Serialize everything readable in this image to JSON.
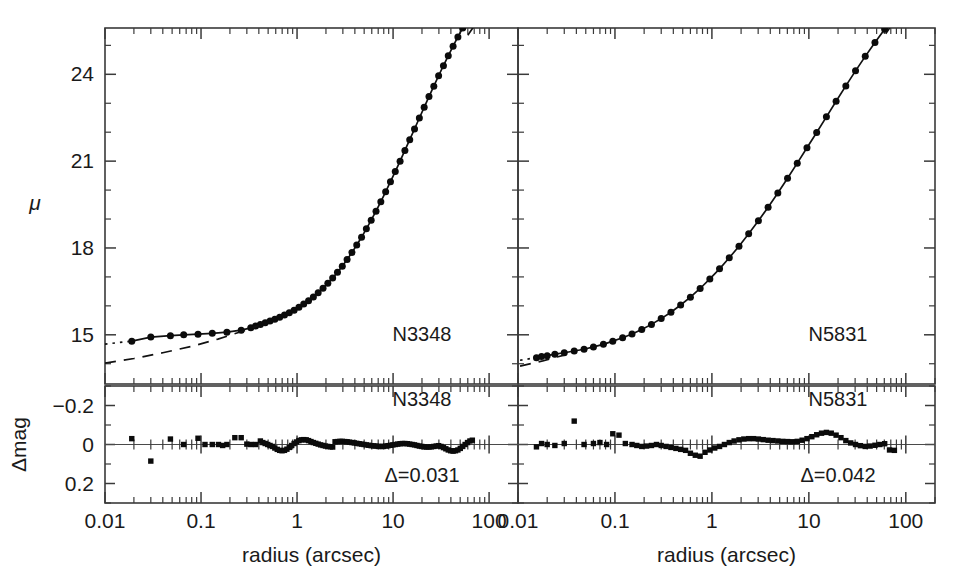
{
  "figure": {
    "background": "#ffffff",
    "ink_color": "#1a1a1a",
    "width": 962,
    "height": 576
  },
  "axis_titles": {
    "x": "radius (arcsec)",
    "y_main": "μ",
    "y_resid": "Δmag"
  },
  "x_tick_labels": [
    "0.01",
    "0.1",
    "1",
    "10",
    "100"
  ],
  "x_tick_values": [
    0.01,
    0.1,
    1,
    10,
    100
  ],
  "y_main_tick_labels": [
    "15",
    "18",
    "21",
    "24"
  ],
  "y_main_tick_values": [
    15,
    18,
    21,
    24
  ],
  "y_resid_tick_labels": [
    "−0.2",
    "0",
    "0.2"
  ],
  "y_resid_tick_values": [
    -0.2,
    0,
    0.2
  ],
  "panels": [
    {
      "id": "left",
      "galaxy_label": "N3348",
      "resid_galaxy_label": "N3348",
      "delta_label": "Δ=0.031"
    },
    {
      "id": "right",
      "galaxy_label": "N5831",
      "resid_galaxy_label": "N5831",
      "delta_label": "Δ=0.042"
    }
  ],
  "chart_data": {
    "type": "line",
    "title": "",
    "subtitle": "",
    "xlabel": "radius (arcsec)",
    "ylabel": "μ",
    "xscale": "log",
    "xlim": [
      0.01,
      200
    ],
    "grid": false,
    "legend": "none",
    "subplots": [
      {
        "name": "N3348",
        "panel": "left-main",
        "ylabel": "μ",
        "ylim": [
          25.6,
          13.3
        ],
        "y_inverted": true,
        "annotations": [
          {
            "text": "N3348",
            "x": 20,
            "y": 14.8
          }
        ],
        "series": [
          {
            "name": "observed surface brightness",
            "style": "solid-with-filled-circles",
            "marker": "filled-circle",
            "x": [
              0.019,
              0.03,
              0.048,
              0.066,
              0.093,
              0.131,
              0.186,
              0.262,
              0.33,
              0.37,
              0.415,
              0.466,
              0.523,
              0.587,
              0.659,
              0.74,
              0.83,
              0.932,
              1.046,
              1.174,
              1.318,
              1.479,
              1.66,
              1.864,
              2.092,
              2.349,
              2.636,
              2.959,
              3.321,
              3.728,
              4.184,
              4.697,
              5.272,
              5.918,
              6.643,
              7.456,
              8.369,
              9.394,
              10.54,
              11.83,
              13.28,
              14.91,
              16.73,
              18.78,
              21.08,
              23.66,
              26.56,
              29.81,
              33.46,
              37.56,
              42.16,
              47.32,
              53.12,
              59.62,
              66.92
            ],
            "y": [
              14.78,
              14.92,
              14.97,
              15.0,
              15.02,
              15.05,
              15.09,
              15.16,
              15.24,
              15.3,
              15.36,
              15.42,
              15.48,
              15.54,
              15.61,
              15.68,
              15.76,
              15.85,
              15.95,
              16.06,
              16.18,
              16.31,
              16.45,
              16.61,
              16.78,
              16.96,
              17.16,
              17.37,
              17.6,
              17.84,
              18.1,
              18.37,
              18.66,
              18.96,
              19.27,
              19.6,
              19.94,
              20.29,
              20.64,
              21.0,
              21.37,
              21.74,
              22.11,
              22.49,
              22.86,
              23.23,
              23.59,
              23.95,
              24.3,
              24.64,
              24.97,
              25.29,
              25.6,
              25.88,
              26.12
            ]
          },
          {
            "name": "inward dotted extrapolation",
            "style": "dotted",
            "x": [
              0.01,
              0.019
            ],
            "y": [
              14.68,
              14.78
            ]
          },
          {
            "name": "outer power-law dashed extrapolation",
            "style": "dashed",
            "x": [
              0.01,
              0.02,
              0.04,
              0.08,
              0.15,
              0.28,
              0.4
            ],
            "y": [
              14.02,
              14.18,
              14.38,
              14.6,
              14.85,
              15.14,
              15.32
            ]
          },
          {
            "name": "outer dash-dot extrapolation",
            "style": "dash-dot",
            "x": [
              60.0,
              90.0,
              130.0,
              175.0
            ],
            "y": [
              25.35,
              26.2,
              27.1,
              27.9
            ]
          }
        ]
      },
      {
        "name": "N3348 residuals",
        "panel": "left-resid",
        "ylabel": "Δmag",
        "ylim": [
          -0.3,
          0.3
        ],
        "y_inverted": true,
        "rms": 0.031,
        "annotations": [
          {
            "text": "N3348",
            "x": 20,
            "y": -0.2
          },
          {
            "text": "Δ=0.031",
            "x": 20,
            "y": 0.19
          }
        ],
        "series": [
          {
            "name": "fit residuals",
            "style": "filled-squares",
            "marker": "filled-square",
            "x": [
              0.019,
              0.03,
              0.048,
              0.066,
              0.093,
              0.11,
              0.131,
              0.152,
              0.168,
              0.186,
              0.225,
              0.262,
              0.3,
              0.33,
              0.37,
              0.415,
              0.44,
              0.466,
              0.495,
              0.523,
              0.555,
              0.587,
              0.622,
              0.659,
              0.698,
              0.74,
              0.784,
              0.83,
              0.88,
              0.932,
              0.988,
              1.046,
              1.109,
              1.174,
              1.245,
              1.318,
              1.397,
              1.479,
              1.568,
              1.66,
              1.76,
              1.864,
              1.975,
              2.092,
              2.218,
              2.349,
              2.489,
              2.636,
              2.794,
              2.959,
              3.136,
              3.321,
              3.519,
              3.728,
              3.95,
              4.184,
              4.433,
              4.697,
              4.977,
              5.272,
              5.586,
              5.918,
              6.27,
              6.643,
              7.038,
              7.456,
              7.9,
              8.369,
              8.867,
              9.394,
              9.953,
              10.54,
              11.17,
              11.83,
              12.53,
              13.28,
              14.07,
              14.91,
              15.8,
              16.73,
              17.73,
              18.78,
              19.9,
              21.08,
              22.34,
              23.66,
              25.07,
              26.56,
              28.14,
              29.81,
              31.58,
              33.46,
              35.45,
              37.56,
              39.8,
              42.16,
              44.67,
              47.32,
              50.14,
              53.12,
              56.28,
              59.62,
              63.17,
              66.92
            ],
            "y": [
              -0.03,
              0.085,
              -0.028,
              0.0,
              -0.032,
              0.0,
              0.0,
              0.0,
              0.005,
              0.0,
              -0.035,
              -0.035,
              -0.002,
              0.0,
              0.0,
              -0.018,
              -0.01,
              -0.005,
              0.0,
              0.005,
              0.01,
              0.018,
              0.025,
              0.03,
              0.032,
              0.03,
              0.024,
              0.015,
              0.005,
              -0.005,
              -0.013,
              -0.02,
              -0.024,
              -0.025,
              -0.024,
              -0.02,
              -0.015,
              -0.01,
              -0.006,
              -0.002,
              0.002,
              0.005,
              0.008,
              0.01,
              0.012,
              0.013,
              -0.014,
              -0.015,
              -0.016,
              -0.016,
              -0.015,
              -0.014,
              -0.012,
              -0.01,
              -0.008,
              -0.006,
              -0.004,
              -0.002,
              0.0,
              0.002,
              0.004,
              0.006,
              0.007,
              0.008,
              0.01,
              0.01,
              0.01,
              0.008,
              0.006,
              0.004,
              0.002,
              0.0,
              -0.002,
              -0.004,
              -0.005,
              -0.005,
              -0.004,
              -0.002,
              0.0,
              0.002,
              0.005,
              0.008,
              0.01,
              0.012,
              0.013,
              0.013,
              0.012,
              0.01,
              0.008,
              0.006,
              0.01,
              0.016,
              0.022,
              0.028,
              0.032,
              0.034,
              0.032,
              0.028,
              0.02,
              0.01,
              0.0,
              -0.01,
              -0.018,
              -0.022
            ]
          }
        ]
      },
      {
        "name": "N5831",
        "panel": "right-main",
        "ylabel": "μ",
        "ylim": [
          25.6,
          13.3
        ],
        "y_inverted": true,
        "annotations": [
          {
            "text": "N5831",
            "x": 20,
            "y": 14.8
          }
        ],
        "series": [
          {
            "name": "observed surface brightness",
            "style": "solid-with-filled-circles",
            "marker": "filled-circle",
            "x": [
              0.0155,
              0.0175,
              0.02,
              0.024,
              0.03,
              0.038,
              0.048,
              0.06,
              0.076,
              0.095,
              0.12,
              0.15,
              0.189,
              0.238,
              0.3,
              0.378,
              0.476,
              0.6,
              0.756,
              0.952,
              1.199,
              1.51,
              1.902,
              2.395,
              3.017,
              3.8,
              4.786,
              6.028,
              7.592,
              9.562,
              12.04,
              15.17,
              19.1,
              24.06,
              30.3,
              38.16,
              48.06,
              60.53,
              76.24
            ],
            "y": [
              14.21,
              14.25,
              14.28,
              14.33,
              14.38,
              14.44,
              14.5,
              14.58,
              14.67,
              14.78,
              14.9,
              15.03,
              15.18,
              15.36,
              15.56,
              15.78,
              16.03,
              16.3,
              16.6,
              16.93,
              17.28,
              17.66,
              18.06,
              18.49,
              18.94,
              19.41,
              19.9,
              20.41,
              20.93,
              21.46,
              21.99,
              22.53,
              23.07,
              23.6,
              24.12,
              24.62,
              25.1,
              25.56,
              25.99
            ]
          },
          {
            "name": "inward dotted extrapolation",
            "style": "dotted",
            "x": [
              0.0105,
              0.0155
            ],
            "y": [
              14.12,
              14.21
            ]
          },
          {
            "name": "inner dashed extrapolation",
            "style": "dashed",
            "x": [
              0.0105,
              0.018,
              0.03
            ],
            "y": [
              13.92,
              14.1,
              14.3
            ]
          },
          {
            "name": "outer dash-dot extrapolation",
            "style": "dash-dot",
            "x": [
              62.0,
              90.0,
              130.0,
              180.0
            ],
            "y": [
              25.4,
              26.2,
              27.05,
              27.85
            ]
          }
        ]
      },
      {
        "name": "N5831 residuals",
        "panel": "right-resid",
        "ylabel": "Δmag",
        "ylim": [
          -0.3,
          0.3
        ],
        "y_inverted": true,
        "rms": 0.042,
        "annotations": [
          {
            "text": "N5831",
            "x": 20,
            "y": -0.2
          },
          {
            "text": "Δ=0.042",
            "x": 20,
            "y": 0.19
          }
        ],
        "series": [
          {
            "name": "fit residuals",
            "style": "filled-squares",
            "marker": "filled-square",
            "x": [
              0.0155,
              0.0175,
              0.02,
              0.024,
              0.03,
              0.038,
              0.048,
              0.06,
              0.07,
              0.082,
              0.095,
              0.11,
              0.128,
              0.15,
              0.168,
              0.189,
              0.212,
              0.238,
              0.268,
              0.3,
              0.337,
              0.378,
              0.425,
              0.476,
              0.535,
              0.6,
              0.674,
              0.756,
              0.849,
              0.952,
              1.069,
              1.199,
              1.346,
              1.51,
              1.695,
              1.902,
              2.134,
              2.395,
              2.688,
              3.017,
              3.385,
              3.8,
              4.264,
              4.786,
              5.37,
              6.028,
              6.765,
              7.592,
              8.52,
              9.562,
              10.73,
              12.04,
              13.51,
              15.17,
              17.02,
              19.1,
              21.44,
              24.06,
              27.0,
              30.3,
              34.01,
              38.16,
              42.83,
              48.06,
              53.94,
              60.53,
              67.93,
              76.24
            ],
            "y": [
              0.012,
              -0.005,
              0.0,
              0.005,
              -0.005,
              -0.12,
              0.0,
              -0.005,
              -0.01,
              0.0,
              -0.055,
              -0.048,
              -0.005,
              0.0,
              0.005,
              0.01,
              0.008,
              0.005,
              0.0,
              0.005,
              0.01,
              0.015,
              0.02,
              0.025,
              0.03,
              0.045,
              0.055,
              0.06,
              0.04,
              0.028,
              0.018,
              0.01,
              0.0,
              -0.01,
              -0.018,
              -0.024,
              -0.028,
              -0.03,
              -0.03,
              -0.028,
              -0.025,
              -0.022,
              -0.02,
              -0.018,
              -0.016,
              -0.015,
              -0.014,
              -0.016,
              -0.022,
              -0.03,
              -0.04,
              -0.05,
              -0.058,
              -0.062,
              -0.058,
              -0.048,
              -0.035,
              -0.02,
              -0.008,
              0.0,
              0.006,
              0.01,
              0.008,
              0.004,
              0.0,
              -0.004,
              0.028,
              0.03
            ]
          }
        ]
      }
    ]
  }
}
